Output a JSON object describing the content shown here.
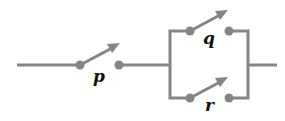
{
  "diagram": {
    "type": "switching-circuit",
    "colors": {
      "wire": "#858585",
      "label": "#111111",
      "background": "#ffffff"
    },
    "switches": [
      {
        "id": "p",
        "label": "p",
        "position": "series",
        "state": "open"
      },
      {
        "id": "q",
        "label": "q",
        "position": "parallel-top",
        "state": "open"
      },
      {
        "id": "r",
        "label": "r",
        "position": "parallel-bottom",
        "state": "open"
      }
    ]
  }
}
